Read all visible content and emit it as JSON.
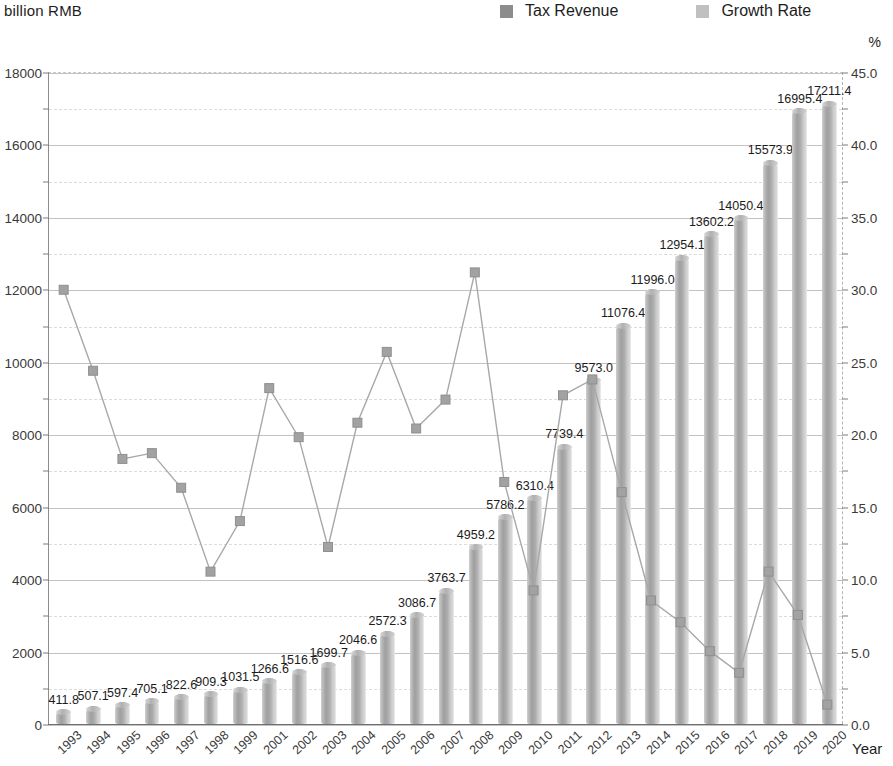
{
  "axis_unit_left": "billion RMB",
  "axis_unit_right": "%",
  "xaxis_title": "Year",
  "legend": {
    "items": [
      {
        "label": "Tax Revenue",
        "color": "#8c8c8c",
        "icon": "square-swatch"
      },
      {
        "label": "Growth Rate",
        "color": "#c0c0c0",
        "icon": "square-swatch"
      }
    ]
  },
  "chart_data": {
    "type": "bar",
    "title": "",
    "subtitle": "",
    "xlabel": "Year",
    "ylabel": "billion RMB",
    "y2label": "%",
    "ylim": [
      0,
      18000
    ],
    "y2lim": [
      0,
      45
    ],
    "ytick_step": 2000,
    "y2tick_step": 5,
    "grid": true,
    "legend_position": "top",
    "categories": [
      "1993",
      "1994",
      "1995",
      "1996",
      "1997",
      "1998",
      "1999",
      "2001",
      "2002",
      "2003",
      "2004",
      "2005",
      "2006",
      "2007",
      "2008",
      "2009",
      "2010",
      "2011",
      "2012",
      "2013",
      "2014",
      "2015",
      "2016",
      "2017",
      "2018",
      "2019",
      "2020"
    ],
    "ytick_labels": [
      "0",
      "2000",
      "4000",
      "6000",
      "8000",
      "10000",
      "12000",
      "14000",
      "16000",
      "18000"
    ],
    "y2tick_labels": [
      "0.0",
      "5.0",
      "10.0",
      "15.0",
      "20.0",
      "25.0",
      "30.0",
      "35.0",
      "40.0",
      "45.0"
    ],
    "series": [
      {
        "name": "Tax Revenue",
        "type": "bar",
        "axis": "left",
        "unit": "billion RMB",
        "color": "#9f9f9f",
        "labels": [
          "411.8",
          "507.1",
          "597.4",
          "705.1",
          "822.6",
          "909.3",
          "1031.5",
          "1266.6",
          "1516.6",
          "1699.7",
          "2046.6",
          "2572.3",
          "3086.7",
          "3763.7",
          "4959.2",
          "5786.2",
          "6310.4",
          "7739.4",
          "9573.0",
          "11076.4",
          "11996.0",
          "12954.1",
          "13602.2",
          "14050.4",
          "15573.9",
          "16995.4",
          "17211.4"
        ],
        "values": [
          411.8,
          507.1,
          597.4,
          705.1,
          822.6,
          909.3,
          1031.5,
          1266.6,
          1516.6,
          1699.7,
          2046.6,
          2572.3,
          3086.7,
          3763.7,
          4959.2,
          5786.2,
          6310.4,
          7739.4,
          9573.0,
          11076.4,
          11996.0,
          12954.1,
          13602.2,
          14050.4,
          15573.9,
          16995.4,
          17211.4
        ]
      },
      {
        "name": "Growth Rate",
        "type": "line",
        "axis": "right",
        "unit": "%",
        "color": "#a8a8a8",
        "values": [
          30.0,
          24.4,
          18.3,
          18.7,
          16.3,
          10.5,
          14.0,
          23.2,
          19.8,
          12.2,
          20.8,
          25.7,
          20.4,
          22.4,
          31.2,
          16.7,
          9.2,
          22.7,
          23.8,
          16.0,
          8.5,
          7.0,
          5.0,
          3.5,
          10.5,
          7.5,
          1.3
        ]
      }
    ]
  }
}
